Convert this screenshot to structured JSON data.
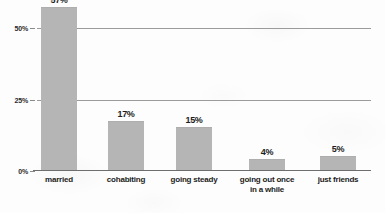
{
  "chart_data": {
    "type": "bar",
    "title": "",
    "subtitle": "",
    "xlabel": "",
    "ylabel": "",
    "categories": [
      "married",
      "cohabiting",
      "going steady",
      "going out once in a while",
      "just friends"
    ],
    "category_lines": [
      [
        "married"
      ],
      [
        "cohabiting"
      ],
      [
        "going steady"
      ],
      [
        "going out once",
        "in a while"
      ],
      [
        "just friends"
      ]
    ],
    "values": [
      57,
      17,
      15,
      4,
      5
    ],
    "value_labels": [
      "57%",
      "17%",
      "15%",
      "4%",
      "5%"
    ],
    "ylim": [
      0,
      57
    ],
    "y_axis_max_display": 57,
    "yticks": [
      0,
      25,
      50
    ],
    "ytick_labels": [
      "0%",
      "25%",
      "50%"
    ],
    "grid": true,
    "gridlines_at": [
      25,
      50
    ],
    "legend": null,
    "legend_position": "none",
    "annotations": []
  },
  "style": {
    "bar_color": "#b5b5b5",
    "gridline_color": "#9b9b9b",
    "axis_color": "#6e6e6e",
    "text_color": "#1c1c1c",
    "background_color": "#fdfdfd"
  }
}
